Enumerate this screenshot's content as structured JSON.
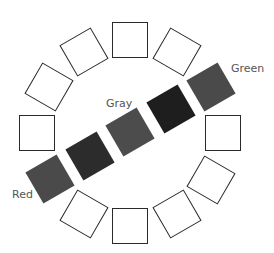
{
  "diagram": {
    "type": "circular color-wheel arrangement",
    "center": [
      130,
      133
    ],
    "radius": 93,
    "square_size": 36,
    "outline_color": "#2a2a2a",
    "ring_squares": [
      {
        "angle": 0,
        "style": "outline"
      },
      {
        "angle": 60,
        "style": "outline"
      },
      {
        "angle": 90,
        "style": "outline"
      },
      {
        "angle": 120,
        "style": "outline"
      },
      {
        "angle": 150,
        "style": "outline"
      },
      {
        "angle": 180,
        "style": "outline"
      },
      {
        "angle": 240,
        "style": "outline"
      },
      {
        "angle": 270,
        "style": "outline"
      },
      {
        "angle": 300,
        "style": "outline"
      },
      {
        "angle": 330,
        "style": "outline"
      }
    ],
    "diagonal_squares": [
      {
        "id": "red",
        "pos": [
          50,
          179
        ],
        "rotation": -30,
        "color": "#4a4a4a"
      },
      {
        "id": "mid1",
        "pos": [
          90,
          156
        ],
        "rotation": -30,
        "color": "#2c2c2c"
      },
      {
        "id": "gray",
        "pos": [
          130,
          132
        ],
        "rotation": -30,
        "color": "#4c4c4c"
      },
      {
        "id": "mid2",
        "pos": [
          171,
          109
        ],
        "rotation": -30,
        "color": "#1e1e1e"
      },
      {
        "id": "green",
        "pos": [
          211,
          87
        ],
        "rotation": -30,
        "color": "#4a4a4a"
      }
    ],
    "labels": {
      "green": "Green",
      "gray": "Gray",
      "red": "Red"
    }
  }
}
